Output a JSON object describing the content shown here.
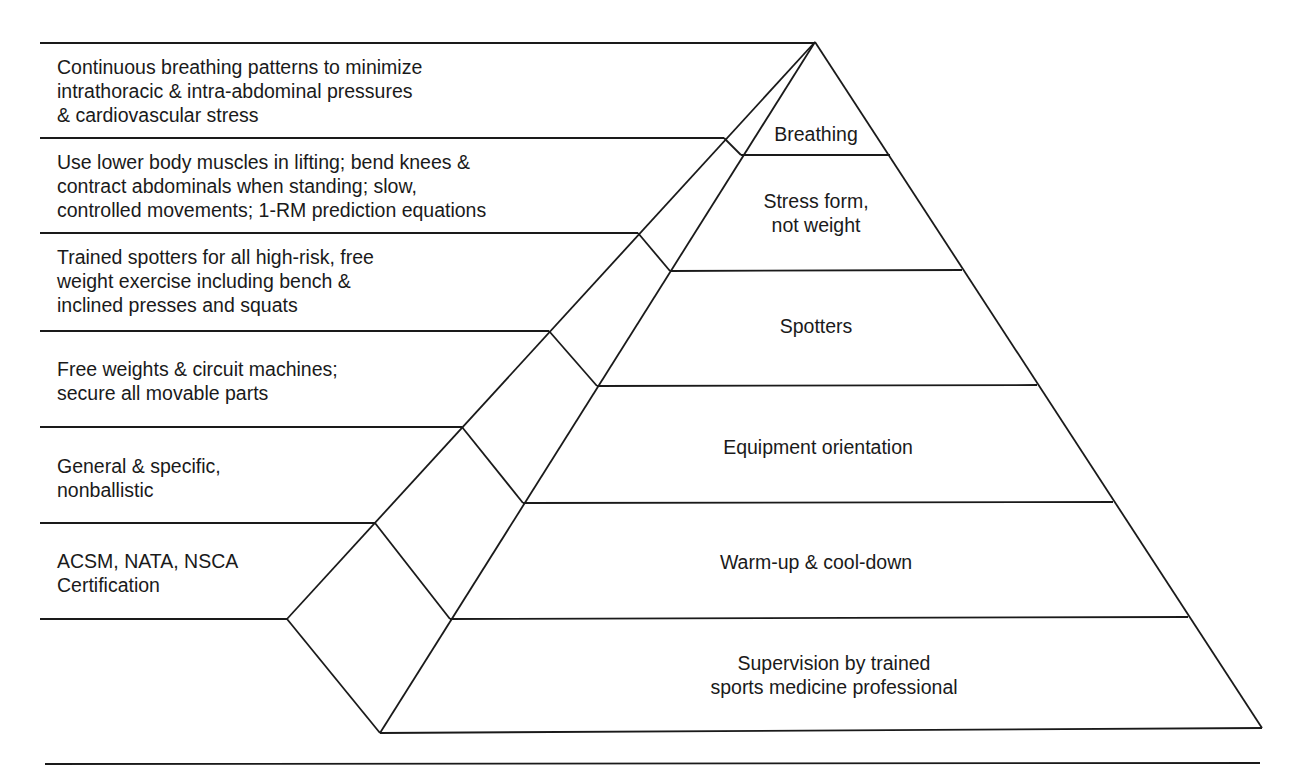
{
  "diagram": {
    "type": "pyramid",
    "tiers_top_to_bottom": [
      {
        "id": "breathing",
        "label": "Breathing",
        "description": "Continuous breathing patterns to minimize\nintrathoracic & intra-abdominal pressures\n& cardiovascular stress"
      },
      {
        "id": "stress-form",
        "label": "Stress form,\nnot weight",
        "description": "Use lower body muscles in lifting; bend knees &\ncontract abdominals when standing; slow,\ncontrolled movements; 1-RM prediction equations"
      },
      {
        "id": "spotters",
        "label": "Spotters",
        "description": "Trained spotters for all high-risk, free\nweight exercise including bench &\ninclined presses and squats"
      },
      {
        "id": "equipment-orientation",
        "label": "Equipment orientation",
        "description": "Free weights & circuit machines;\nsecure all movable parts"
      },
      {
        "id": "warm-up",
        "label": "Warm-up & cool-down",
        "description": "General & specific,\nnonballistic"
      },
      {
        "id": "supervision",
        "label": "Supervision by trained\nsports medicine professional",
        "description": "ACSM, NATA, NSCA\nCertification"
      }
    ]
  },
  "side": {
    "d0": [
      "Continuous breathing patterns to minimize",
      "intrathoracic & intra-abdominal pressures",
      "& cardiovascular stress"
    ],
    "d1": [
      "Use lower body muscles in lifting; bend knees &",
      "contract abdominals when standing; slow,",
      "controlled movements; 1-RM prediction equations"
    ],
    "d2": [
      "Trained spotters for all high-risk, free",
      "weight exercise including bench &",
      "inclined presses and squats"
    ],
    "d3": [
      "Free weights & circuit machines;",
      "secure all movable parts"
    ],
    "d4": [
      "General & specific,",
      "nonballistic"
    ],
    "d5": [
      "ACSM, NATA, NSCA",
      "Certification"
    ]
  },
  "tiers": {
    "t0": [
      "Breathing"
    ],
    "t1": [
      "Stress form,",
      "not weight"
    ],
    "t2": [
      "Spotters"
    ],
    "t3": [
      "Equipment orientation"
    ],
    "t4": [
      "Warm-up & cool-down"
    ],
    "t5": [
      "Supervision by trained",
      "sports medicine professional"
    ]
  },
  "colors": {
    "line": "#1a1a1a",
    "background": "#ffffff"
  }
}
